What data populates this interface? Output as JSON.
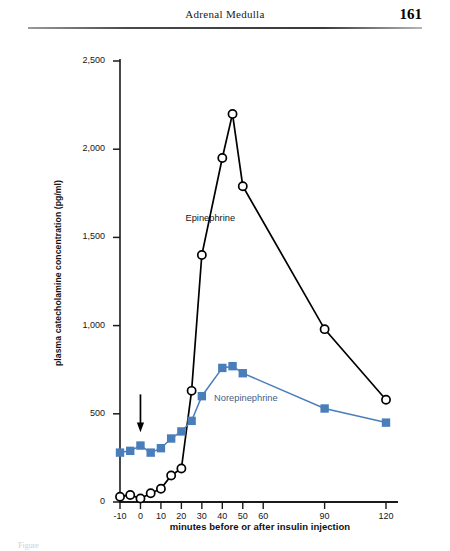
{
  "header": {
    "title": "Adrenal Medulla",
    "page_number": "161"
  },
  "figure": {
    "caption_partial": "Figure",
    "epinephrine_label": "Epinephrine",
    "norepinephrine_label": "Norepinephrine",
    "arrow_name": "insulin-injection-arrow"
  },
  "colors": {
    "epinephrine": "#000000",
    "norepinephrine": "#4a7ebb",
    "axis": "#1a1a1a",
    "text": "#161616"
  },
  "chart_data": {
    "type": "line",
    "title": "",
    "xlabel": "minutes before or after insulin injection",
    "ylabel": "plasma catecholamine concentration (pg/ml)",
    "x": [
      -10,
      -5,
      0,
      5,
      10,
      15,
      20,
      25,
      30,
      40,
      45,
      50,
      90,
      120
    ],
    "xticks": [
      -10,
      0,
      10,
      20,
      30,
      40,
      50,
      60,
      90,
      120
    ],
    "xticklabels": [
      "-10",
      "0",
      "10",
      "20",
      "30",
      "40",
      "50",
      "60",
      "90",
      "120"
    ],
    "xlim": [
      -10,
      120
    ],
    "yticks": [
      0,
      500,
      1000,
      1500,
      2000,
      2500
    ],
    "yticklabels": [
      "0",
      "500",
      "1,000",
      "1,500",
      "2,000",
      "2,500"
    ],
    "ylim": [
      0,
      2500
    ],
    "grid": false,
    "legend": "inline-annotations",
    "annotations": [
      {
        "text": "Epinephrine",
        "x": 22,
        "y": 1600
      },
      {
        "text": "Norepinephrine",
        "x": 36,
        "y": 580
      },
      {
        "text": "arrow",
        "x": 0,
        "y": 520,
        "note": "downward arrow marking insulin injection"
      }
    ],
    "series": [
      {
        "name": "Epinephrine",
        "marker": "open-circle",
        "color": "#000000",
        "values": [
          30,
          40,
          20,
          50,
          75,
          150,
          190,
          630,
          1400,
          1950,
          2200,
          1790,
          980,
          580
        ]
      },
      {
        "name": "Norepinephrine",
        "marker": "filled-square",
        "color": "#4a7ebb",
        "values": [
          280,
          290,
          320,
          280,
          305,
          360,
          400,
          460,
          600,
          760,
          770,
          730,
          530,
          450
        ]
      }
    ]
  }
}
